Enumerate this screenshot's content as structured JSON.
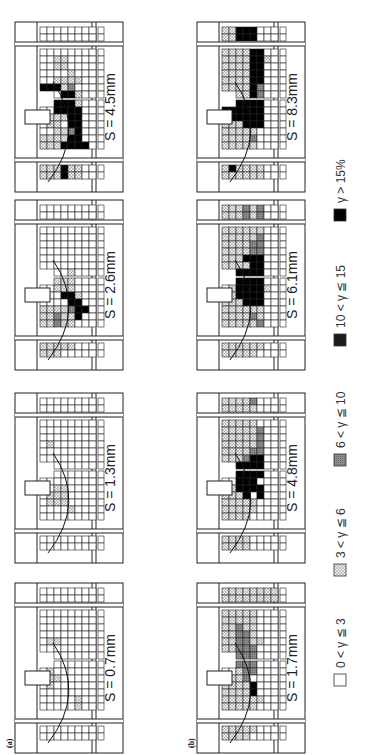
{
  "figure": {
    "orientation": "rotated-90-ccw",
    "panel_labels": [
      "(a)",
      "(b)"
    ],
    "legend": [
      {
        "label": "0 < γ ≦ 3",
        "level": 0,
        "color": "#ffffff"
      },
      {
        "label": "3 < γ ≦ 6",
        "level": 1,
        "color": "#d6d6d6"
      },
      {
        "label": "6 < γ ≦ 10",
        "level": 2,
        "color": "#9a9a9a"
      },
      {
        "label": "10 < γ ≦ 15",
        "level": 3,
        "color": "#2a2a2a"
      },
      {
        "label": "γ > 15%",
        "level": 4,
        "color": "#000000"
      }
    ],
    "rows": [
      {
        "label": "(a)",
        "panels": [
          {
            "s_label": "S = 0.7mm",
            "cells": [
              "00000000",
              "00000000",
              "00000000",
              "00000000",
              "00000000",
              "00000000",
              "01100000",
              "00000000",
              "10000000",
              "00000000",
              "01000000",
              "01100000",
              "01000000",
              "00000000",
              "00000100",
              "00000100",
              "00000000",
              "00000000"
            ]
          },
          {
            "s_label": "S = 1.3mm",
            "cells": [
              "00000000",
              "00000000",
              "00000000",
              "00000000",
              "00000000",
              "01000000",
              "00000000",
              "00000000",
              "00000000",
              "00000000",
              "00000000",
              "00110000",
              "01110000",
              "01110000",
              "00001000",
              "00000000",
              "00000000",
              "00000000"
            ]
          },
          {
            "s_label": "S = 2.6mm",
            "cells": [
              "00000000",
              "00000000",
              "00000000",
              "00000000",
              "00000000",
              "00000000",
              "00000000",
              "00000000",
              "00001000",
              "11111000",
              "00111000",
              "00044100",
              "00004400",
              "11112440",
              "11211400",
              "11211000",
              "11111000",
              "11100000"
            ]
          },
          {
            "s_label": "S = 4.5mm",
            "cells": [
              "00000000",
              "00000000",
              "00000000",
              "00110000",
              "00110000",
              "00001000",
              "00111100",
              "44412000",
              "00044100",
              "00444100",
              "00444400",
              "01114400",
              "01104400",
              "00112400",
              "11114400",
              "11144440",
              "11141100",
              "11141100"
            ]
          }
        ]
      },
      {
        "label": "(b)",
        "panels": [
          {
            "s_label": "S = 1.7mm",
            "cells": [
              "11111111",
              "11111111",
              "11111000",
              "11111000",
              "11211000",
              "11221000",
              "11221100",
              "11222000",
              "11222000",
              "01222000",
              "00122000",
              "11120000",
              "11114000",
              "11114000",
              "11111100",
              "11111000",
              "11111000",
              "11110000"
            ]
          },
          {
            "s_label": "S = 4.8mm",
            "cells": [
              "11112000",
              "11111000",
              "11111000",
              "11111200",
              "11111200",
              "11111200",
              "11112200",
              "11124400",
              "11444400",
              "00444400",
              "00444000",
              "01444400",
              "11140400",
              "11111000",
              "11111000",
              "11110000",
              "11110000",
              "11110000"
            ]
          },
          {
            "s_label": "S = 6.1mm",
            "cells": [
              "11121200",
              "11121200",
              "11111100",
              "11111200",
              "11112200",
              "11112200",
              "11144400",
              "11114400",
              "01444400",
              "01444400",
              "01444410",
              "01444400",
              "11144400",
              "11111100",
              "11112100",
              "11111200",
              "11111100",
              "11111000"
            ]
          },
          {
            "s_label": "S = 8.3mm",
            "cells": [
              "11444000",
              "11444000",
              "11114400",
              "11114410",
              "11114400",
              "11114400",
              "11114400",
              "11114200",
              "11114200",
              "44444400",
              "44444400",
              "44444400",
              "11144400",
              "11111000",
              "11112000",
              "11111000",
              "14111100",
              "11111100"
            ]
          }
        ]
      }
    ]
  }
}
